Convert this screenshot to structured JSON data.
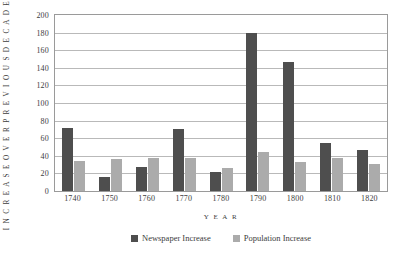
{
  "chart_data": {
    "type": "bar",
    "title": "",
    "subtitle": "",
    "xlabel": "Y E A R",
    "ylabel": "I N C R E A S E   O V E R   P R E V I O U S   D E C A D E  ( % )",
    "categories": [
      "1740",
      "1750",
      "1760",
      "1770",
      "1780",
      "1790",
      "1800",
      "1810",
      "1820"
    ],
    "series": [
      {
        "name": "Newspaper Increase",
        "color": "#4e4e4e",
        "values": [
          72,
          16,
          27,
          71,
          22,
          180,
          147,
          55,
          47
        ]
      },
      {
        "name": "Population Increase",
        "color": "#ababab",
        "values": [
          34,
          36,
          38,
          38,
          26,
          44,
          33,
          37,
          31
        ]
      }
    ],
    "ylim": [
      0,
      200
    ],
    "yticks": [
      0,
      20,
      40,
      60,
      80,
      100,
      120,
      140,
      160,
      180,
      200
    ],
    "ytick_labels": [
      "0",
      "20",
      "40",
      "60",
      "80",
      "100",
      "120",
      "140",
      "160",
      "180",
      "200"
    ],
    "grid": true,
    "grid_axis": "y",
    "legend_position": "bottom-center",
    "legend_entries": [
      "Newspaper Increase",
      "Population Increase"
    ],
    "plot_border_color": "#9a9a9a",
    "gridline_color": "#b9b9b9",
    "background_color": "#ffffff"
  }
}
